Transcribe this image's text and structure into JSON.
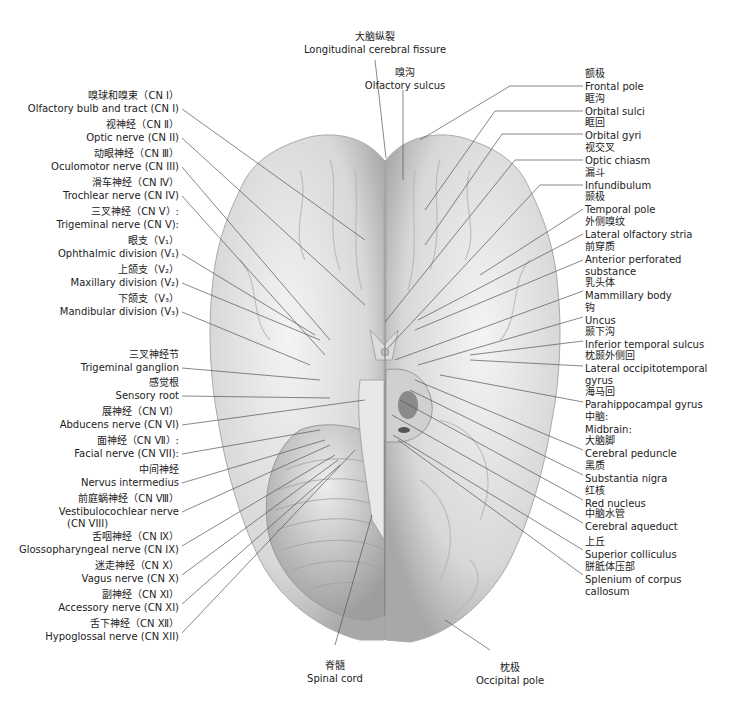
{
  "figure": {
    "type": "anatomical-diagram"
  },
  "top_labels": [
    {
      "zh": "大脑纵裂",
      "en": "Longitudinal cerebral fissure"
    },
    {
      "zh": "嗅沟",
      "en": "Olfactory sulcus"
    }
  ],
  "left_labels": [
    {
      "zh": "嗅球和嗅束（CN Ⅰ）",
      "en": "Olfactory bulb and tract (CN I)"
    },
    {
      "zh": "视神经（CN Ⅱ）",
      "en": "Optic nerve (CN II)"
    },
    {
      "zh": "动眼神经（CN Ⅲ）",
      "en": "Oculomotor nerve (CN III)"
    },
    {
      "zh": "滑车神经（CN Ⅳ）",
      "en": "Trochlear nerve (CN IV)"
    },
    {
      "zh": "三叉神经（CN Ⅴ）:",
      "en": "Trigeminal nerve (CN V):"
    },
    {
      "zh": "眼支（V₁）",
      "en": "Ophthalmic division (V₁)"
    },
    {
      "zh": "上颌支（V₂）",
      "en": "Maxillary division (V₂)"
    },
    {
      "zh": "下颌支（V₃）",
      "en": "Mandibular division (V₃)"
    },
    {
      "zh": "三叉神经节",
      "en": "Trigeminal ganglion"
    },
    {
      "zh": "感觉根",
      "en": "Sensory root"
    },
    {
      "zh": "展神经（CN Ⅵ）",
      "en": "Abducens nerve (CN VI)"
    },
    {
      "zh": "面神经（CN Ⅶ）:",
      "en": "Facial nerve (CN VII):"
    },
    {
      "zh": "中间神经",
      "en": "Nervus intermedius"
    },
    {
      "zh": "前庭蜗神经（CN Ⅷ）",
      "en": "Vestibulocochlear nerve",
      "en2": "(CN VIII)"
    },
    {
      "zh": "舌咽神经（CN Ⅸ）",
      "en": "Glossopharyngeal nerve (CN IX)"
    },
    {
      "zh": "迷走神经（CN Ⅹ）",
      "en": "Vagus nerve (CN X)"
    },
    {
      "zh": "副神经（CN Ⅺ）",
      "en": "Accessory nerve (CN XI)"
    },
    {
      "zh": "舌下神经（CN Ⅻ）",
      "en": "Hypoglossal nerve (CN XII)"
    }
  ],
  "right_labels": [
    {
      "zh": "额极",
      "en": "Frontal pole"
    },
    {
      "zh": "眶沟",
      "en": "Orbital sulci"
    },
    {
      "zh": "眶回",
      "en": "Orbital gyri"
    },
    {
      "zh": "视交叉",
      "en": "Optic chiasm"
    },
    {
      "zh": "漏斗",
      "en": "Infundibulum"
    },
    {
      "zh": "颞极",
      "en": "Temporal pole"
    },
    {
      "zh": "外侧嗅纹",
      "en": "Lateral olfactory stria"
    },
    {
      "zh": "前穿质",
      "en": "Anterior perforated",
      "en2": "substance"
    },
    {
      "zh": "乳头体",
      "en": "Mammillary body"
    },
    {
      "zh": "钩",
      "en": "Uncus"
    },
    {
      "zh": "颞下沟",
      "en": "Inferior temporal sulcus"
    },
    {
      "zh": "枕颞外侧回",
      "en": "Lateral occipitotemporal",
      "en2": "gyrus"
    },
    {
      "zh": "海马回",
      "en": "Parahippocampal gyrus"
    },
    {
      "zh": "中脑:",
      "en": "Midbrain:"
    },
    {
      "zh": "大脑脚",
      "en": "Cerebral peduncle"
    },
    {
      "zh": "黑质",
      "en": "Substantia nigra"
    },
    {
      "zh": "红核",
      "en": "Red nucleus"
    },
    {
      "zh": "中脑水管",
      "en": "Cerebral aqueduct"
    },
    {
      "zh": "上丘",
      "en": "Superior colliculus"
    },
    {
      "zh": "胼胝体压部",
      "en": "Splenium of corpus",
      "en2": "callosum"
    }
  ],
  "bottom_labels": [
    {
      "zh": "脊髓",
      "en": "Spinal cord"
    },
    {
      "zh": "枕极",
      "en": "Occipital pole"
    }
  ],
  "colors": {
    "background": "#ffffff",
    "brain_fill": "#e6e6e6",
    "brain_shadow": "#9a9a9a",
    "leader_line": "#555555",
    "text": "#222222"
  }
}
